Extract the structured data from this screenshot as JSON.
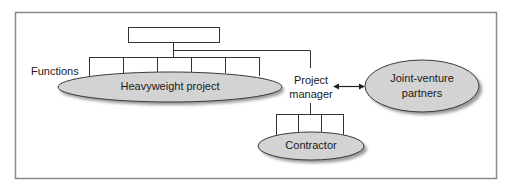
{
  "diagram": {
    "labels": {
      "functions": "Functions",
      "heavyweight_project": "Heavyweight project",
      "project_manager_line1": "Project",
      "project_manager_line2": "manager",
      "joint_venture_line1": "Joint-venture",
      "joint_venture_line2": "partners",
      "contractor": "Contractor"
    },
    "colors": {
      "frame": "#8a8a8a",
      "line": "#333333",
      "ellipse_fill": "#d3d3d3",
      "ellipse_stroke": "#3a3a3a",
      "shadow": "#9a9a9a"
    }
  }
}
